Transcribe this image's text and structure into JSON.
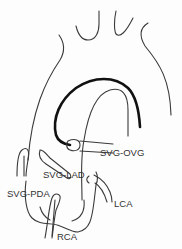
{
  "figure": {
    "type": "anatomical line drawing",
    "labels": [
      {
        "id": "svg-ovg",
        "text": "SVG-OVG"
      },
      {
        "id": "svg-lad",
        "text": "SVG-LAD"
      },
      {
        "id": "svg-pda",
        "text": "SVG-PDA"
      },
      {
        "id": "lca",
        "text": "LCA"
      },
      {
        "id": "rca",
        "text": "RCA"
      }
    ],
    "colors": {
      "line": "#3a3a3a",
      "graft_highlight": "#111111",
      "background": "#fdfdfd"
    }
  }
}
